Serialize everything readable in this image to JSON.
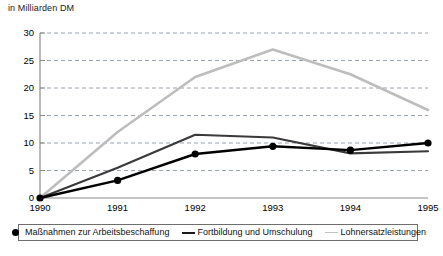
{
  "chart_data": {
    "type": "line",
    "title": "in Milliarden DM",
    "xlabel": "",
    "ylabel": "",
    "ylim": [
      0,
      30
    ],
    "yticks": [
      0,
      5,
      10,
      15,
      20,
      25,
      30
    ],
    "grid": true,
    "legend_position": "bottom",
    "categories": [
      "1990",
      "1991",
      "1992",
      "1993",
      "1994",
      "1995"
    ],
    "x": [
      1990,
      1991,
      1992,
      1993,
      1994,
      1995
    ],
    "series": [
      {
        "name": "Maßnahmen zur Arbeitsbeschaffung",
        "values": [
          0,
          3.2,
          8.0,
          9.4,
          8.7,
          10.0
        ],
        "color": "#000000",
        "marker": "circle",
        "marker_icon": "filled-circle-marker"
      },
      {
        "name": "Fortbildung und Umschulung",
        "values": [
          0,
          5.5,
          11.5,
          11.0,
          8.1,
          8.5
        ],
        "color": "#3a3a3a",
        "marker": "none",
        "marker_icon": "solid-line-marker"
      },
      {
        "name": "Lohnersatzleistungen",
        "values": [
          0,
          12.0,
          22.0,
          27.0,
          22.5,
          16.0
        ],
        "color": "#bdbdbd",
        "marker": "none",
        "marker_icon": "light-line-marker"
      }
    ]
  },
  "axis": {
    "y_tick_labels": [
      "30",
      "25",
      "20",
      "15",
      "10",
      "5",
      "0"
    ],
    "x_tick_labels": [
      "1990",
      "1991",
      "1992",
      "1993",
      "1994",
      "1995"
    ]
  },
  "legend": {
    "entries": [
      {
        "label": "Maßnahmen zur Arbeitsbeschaffung"
      },
      {
        "label": "Fortbildung und Umschulung"
      },
      {
        "label": "Lohnersatzleistungen"
      }
    ]
  },
  "colors": {
    "series_1": "#000000",
    "series_2": "#3a3a3a",
    "series_3": "#bdbdbd",
    "axis": "#888888",
    "grid": "#9aa3b0",
    "legend_border": "#6e6e6e"
  }
}
